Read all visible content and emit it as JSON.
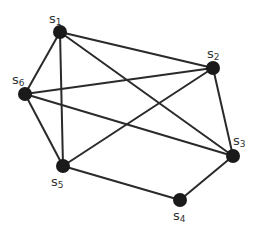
{
  "diagram": {
    "type": "graph",
    "nodes": [
      {
        "id": "S1",
        "base": "s",
        "sub": "1",
        "x": 60,
        "y": 32,
        "lx": 49,
        "ly": 12
      },
      {
        "id": "S2",
        "base": "s",
        "sub": "2",
        "x": 213,
        "y": 68,
        "lx": 207,
        "ly": 47
      },
      {
        "id": "S3",
        "base": "s",
        "sub": "3",
        "x": 233,
        "y": 156,
        "lx": 233,
        "ly": 134
      },
      {
        "id": "S4",
        "base": "s",
        "sub": "4",
        "x": 180,
        "y": 200,
        "lx": 173,
        "ly": 209
      },
      {
        "id": "S5",
        "base": "s",
        "sub": "5",
        "x": 63,
        "y": 166,
        "lx": 51,
        "ly": 175
      },
      {
        "id": "S6",
        "base": "s",
        "sub": "6",
        "x": 25,
        "y": 94,
        "lx": 12,
        "ly": 73
      }
    ],
    "edges": [
      [
        "S1",
        "S2"
      ],
      [
        "S1",
        "S6"
      ],
      [
        "S1",
        "S5"
      ],
      [
        "S1",
        "S3"
      ],
      [
        "S6",
        "S2"
      ],
      [
        "S6",
        "S3"
      ],
      [
        "S6",
        "S5"
      ],
      [
        "S5",
        "S2"
      ],
      [
        "S5",
        "S4"
      ],
      [
        "S4",
        "S3"
      ],
      [
        "S2",
        "S3"
      ]
    ],
    "colors": {
      "node": "#1a1a1a",
      "edge": "#2a2a2a",
      "label": "#333333"
    }
  }
}
